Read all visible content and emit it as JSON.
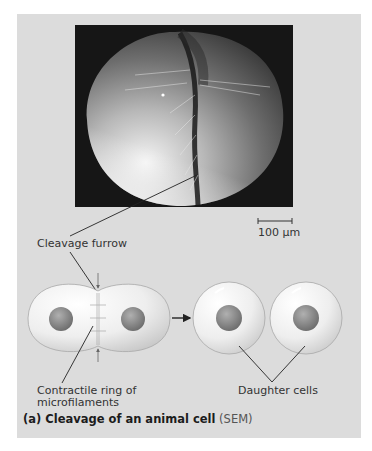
{
  "figure": {
    "panel_color": "#dcdcdc",
    "sem_image": {
      "description": "scanning electron micrograph of a dividing frog egg showing cleavage furrow",
      "scale_bar_label": "100 µm"
    },
    "labels": {
      "cleavage_furrow": "Cleavage furrow",
      "contractile_ring_line1": "Contractile ring of",
      "contractile_ring_line2": "microfilaments",
      "daughter_cells": "Daughter cells"
    },
    "caption": {
      "bold": "(a) Cleavage of an animal cell",
      "tag": " (SEM)"
    }
  }
}
